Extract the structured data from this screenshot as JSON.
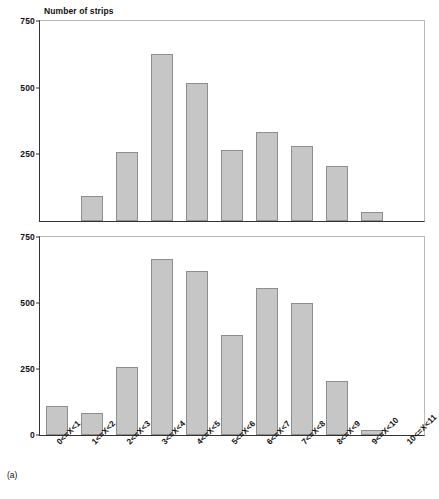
{
  "figure": {
    "panel_label": "(a)",
    "axis_title": "Number of strips"
  },
  "chart_data": {
    "type": "bar",
    "title": "Number of strips",
    "xlabel": "",
    "ylabel": "Number of strips",
    "ylim": [
      0,
      750
    ],
    "yticks": [
      0,
      250,
      500,
      750
    ],
    "grid": false,
    "legend": "none",
    "categories": [
      "0<=X<1",
      "1<=X<2",
      "2<=X<3",
      "3<=X<4",
      "4<=X<5",
      "5<=X<6",
      "6<=X<7",
      "7<=X<8",
      "8<=X<9",
      "9<=X<10",
      "10<=X<11"
    ],
    "panels": [
      {
        "name": "top",
        "ylim": [
          0,
          750
        ],
        "yticks": [
          750,
          500,
          250
        ],
        "ytick_labels": [
          "750",
          "500",
          "250"
        ],
        "values": [
          0,
          95,
          260,
          625,
          518,
          265,
          335,
          280,
          205,
          35,
          0
        ]
      },
      {
        "name": "bottom",
        "ylim": [
          0,
          750
        ],
        "yticks": [
          750,
          500,
          250,
          0
        ],
        "ytick_labels": [
          "750",
          "500",
          "250",
          "0"
        ],
        "values": [
          110,
          85,
          258,
          665,
          620,
          380,
          558,
          500,
          203,
          20,
          0
        ]
      }
    ]
  },
  "colors": {
    "bar_fill": "#c6c6c6",
    "bar_edge": "#8e8e8e",
    "axis": "#333333",
    "frame": "#b9b9b9",
    "text": "#111111"
  }
}
